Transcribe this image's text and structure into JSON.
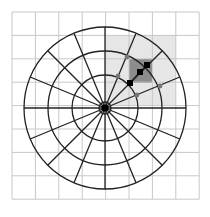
{
  "diagram": {
    "type": "polar-grid-over-cartesian-grid",
    "colors": {
      "background": "#ffffff",
      "cartesian_grid": "#c8c8c8",
      "polar_lines": "#222222",
      "light_region": "#e6e6e6",
      "dark_region": "#8c8c8c",
      "marker_black": "#000000",
      "marker_gray": "#777777"
    },
    "cartesian_grid": {
      "x0": 12,
      "y0": 12,
      "cells": 8,
      "cell_size": 23.4
    },
    "center": {
      "x": 105,
      "y": 108
    },
    "circle_radii": [
      6,
      33,
      57,
      81
    ],
    "radial_line_count": 16,
    "radial_inner_radius": 6,
    "radial_outer_radius": 81,
    "light_region": {
      "x": 105,
      "y": 35,
      "w": 71,
      "h": 70
    },
    "dark_region": {
      "x": 129,
      "y": 59,
      "w": 23,
      "h": 24
    },
    "path_markers": [
      {
        "x": 130,
        "y": 83
      },
      {
        "x": 140,
        "y": 72
      },
      {
        "x": 147,
        "y": 65
      }
    ],
    "gray_markers": [
      {
        "x": 127,
        "y": 57
      },
      {
        "x": 118,
        "y": 76
      },
      {
        "x": 160,
        "y": 86
      },
      {
        "x": 137,
        "y": 95
      }
    ]
  }
}
